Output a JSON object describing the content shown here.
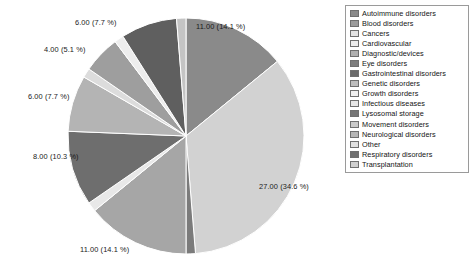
{
  "chart_data": {
    "type": "pie",
    "title": "",
    "total": 78,
    "units": "cases",
    "start_angle_deg": 0,
    "direction": "clockwise",
    "legend_position": "right",
    "grid": false,
    "label_format": "{value} ({percent} %)",
    "categories": [
      "Autoimmune disorders",
      "Blood disorders",
      "Cancers",
      "Cardiovascular",
      "Diagnostic/devices",
      "Eye disorders",
      "Gastrointestinal disorders",
      "Genetic disorders",
      "Growth disorders",
      "Infectious diseases",
      "Lysosomal storage",
      "Movement disorders",
      "Neurological disorders",
      "Other",
      "Respiratory  disorders",
      "Transplantation"
    ],
    "slices": [
      {
        "label": "Autoimmune disorders",
        "value": 11.0,
        "percent": 14.1,
        "color": "#8a8a8a",
        "data_label": "11.00 (14.1 %)",
        "show_label": true
      },
      {
        "label": "Blood disorders",
        "value": 27.0,
        "percent": 34.6,
        "color": "#d2d2d2",
        "data_label": "27.00 (34.6 %)",
        "show_label": true
      },
      {
        "label": "Cancers",
        "value": 1.0,
        "percent": 1.3,
        "color": "#7b7b7b",
        "data_label": "",
        "show_label": false
      },
      {
        "label": "Cardiovascular",
        "value": 11.0,
        "percent": 14.1,
        "color": "#a6a6a6",
        "data_label": "11.00 (14.1 %)",
        "show_label": true
      },
      {
        "label": "Diagnostic/devices",
        "value": 1.0,
        "percent": 1.3,
        "color": "#e8e8e8",
        "data_label": "",
        "show_label": false
      },
      {
        "label": "Eye disorders",
        "value": 8.0,
        "percent": 10.3,
        "color": "#6e6e6e",
        "data_label": "8.00 (10.3 %)",
        "show_label": true
      },
      {
        "label": "Gastrointestinal disorders",
        "value": 6.0,
        "percent": 7.7,
        "color": "#b4b4b4",
        "data_label": "6.00 (7.7 %)",
        "show_label": true
      },
      {
        "label": "Genetic disorders",
        "value": 1.0,
        "percent": 1.3,
        "color": "#dcdcdc",
        "data_label": "",
        "show_label": false
      },
      {
        "label": "Growth disorders",
        "value": 4.0,
        "percent": 5.1,
        "color": "#9e9e9e",
        "data_label": "4.00 (5.1 %)",
        "show_label": true
      },
      {
        "label": "Infectious diseases",
        "value": 1.0,
        "percent": 1.3,
        "color": "#ededed",
        "data_label": "",
        "show_label": false
      },
      {
        "label": "Lysosomal storage",
        "value": 6.0,
        "percent": 7.7,
        "color": "#5f5f5f",
        "data_label": "6.00 (7.7 %)",
        "show_label": true
      },
      {
        "label": "Movement disorders",
        "value": 1.0,
        "percent": 1.3,
        "color": "#c4c4c4",
        "data_label": "",
        "show_label": false
      }
    ],
    "data_labels": [
      "6.00 (7.7 %)",
      "11.00 (14.1 %)",
      "4.00 (5.1 %)",
      "6.00 (7.7 %)",
      "8.00 (10.3 %)",
      "11.00 (14.1 %)",
      "27.00 (34.6 %)"
    ]
  },
  "legend": {
    "items": [
      {
        "label": "Autoimmune disorders",
        "color": "#8a8a8a"
      },
      {
        "label": "Blood disorders",
        "color": "#9c9c9c"
      },
      {
        "label": "Cancers",
        "color": "#e3e3e3"
      },
      {
        "label": "Cardiovascular",
        "color": "#ededed"
      },
      {
        "label": "Diagnostic/devices",
        "color": "#b0b0b0"
      },
      {
        "label": "Eye disorders",
        "color": "#7e7e7e"
      },
      {
        "label": "Gastrointestinal disorders",
        "color": "#6b6b6b"
      },
      {
        "label": "Genetic disorders",
        "color": "#bdbdbd"
      },
      {
        "label": "Growth disorders",
        "color": "#efefef"
      },
      {
        "label": "Infectious diseases",
        "color": "#e6e6e6"
      },
      {
        "label": "Lysosomal storage",
        "color": "#767676"
      },
      {
        "label": "Movement disorders",
        "color": "#c9c9c9"
      },
      {
        "label": "Neurological disorders",
        "color": "#b6b6b6"
      },
      {
        "label": "Other",
        "color": "#e0e0e0"
      },
      {
        "label": "Respiratory  disorders",
        "color": "#707070"
      },
      {
        "label": "Transplantation",
        "color": "#cfcfcf"
      }
    ]
  },
  "label_positions": [
    {
      "key": "top-left-6",
      "text": "6.00 (7.7 %)",
      "left": 75,
      "top": 18
    },
    {
      "key": "top-right-11",
      "text": "11.00 (14.1 %)",
      "left": 196,
      "top": 22
    },
    {
      "key": "left-4",
      "text": "4.00 (5.1 %)",
      "left": 44,
      "top": 45
    },
    {
      "key": "left-6",
      "text": "6.00 (7.7 %)",
      "left": 28,
      "top": 92
    },
    {
      "key": "left-8",
      "text": "8.00 (10.3 %)",
      "left": 33,
      "top": 152
    },
    {
      "key": "bottom-11",
      "text": "11.00 (14.1 %)",
      "left": 80,
      "top": 245
    },
    {
      "key": "right-27",
      "text": "27.00 (34.6 %)",
      "left": 259,
      "top": 182
    }
  ]
}
